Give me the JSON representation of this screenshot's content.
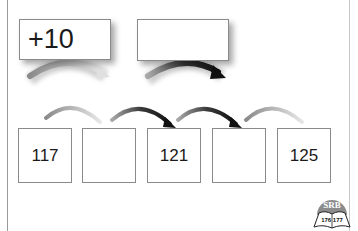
{
  "operation_boxes": [
    {
      "label": "+10",
      "filled": true
    },
    {
      "label": "",
      "filled": false
    }
  ],
  "number_line": [
    {
      "value": "117"
    },
    {
      "value": ""
    },
    {
      "value": "121"
    },
    {
      "value": ""
    },
    {
      "value": "125"
    }
  ],
  "logo": {
    "brand": "SRB",
    "pages": "176 177"
  },
  "colors": {
    "light_arrow": "#bdbdbd",
    "dark_arrow": "#1e1e1e",
    "box_border": "#8a8a8a"
  }
}
